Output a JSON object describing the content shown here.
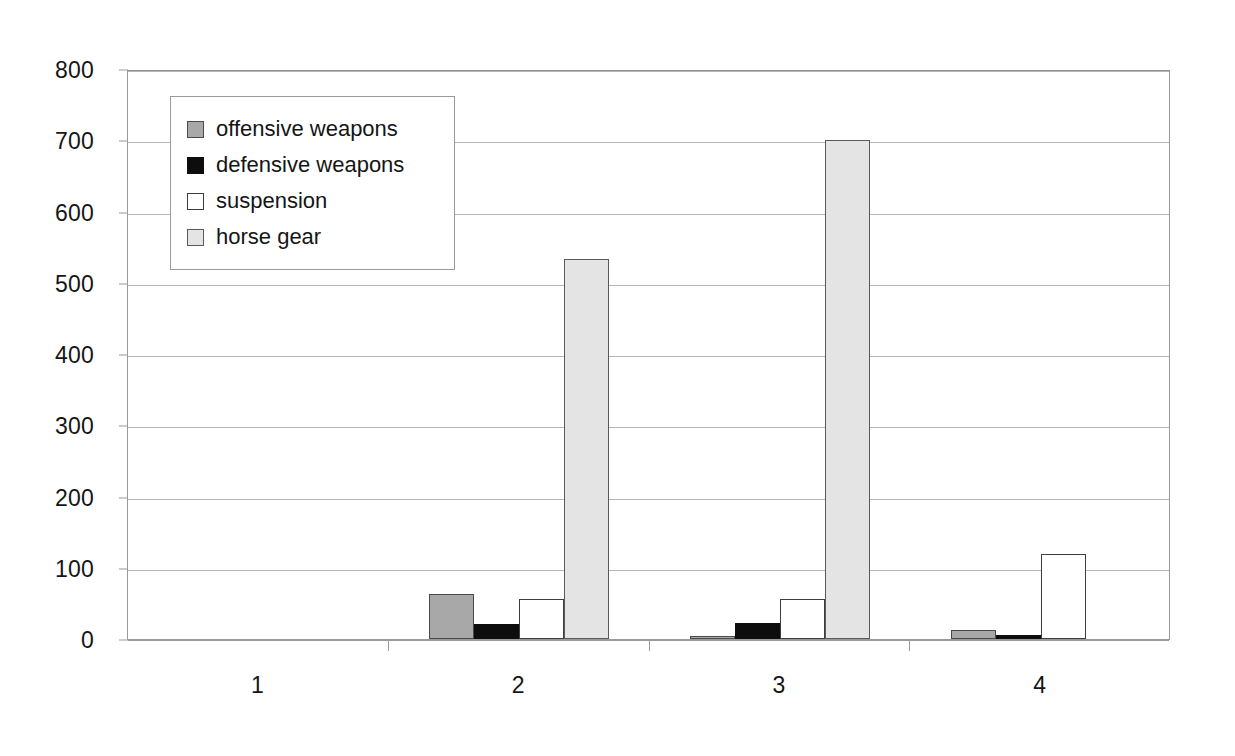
{
  "chart_data": {
    "type": "bar",
    "title": "",
    "subtitle": "",
    "xlabel": "",
    "ylabel": "",
    "categories": [
      "1",
      "2",
      "3",
      "4"
    ],
    "series": [
      {
        "name": "offensive weapons",
        "color": "#a8a8a8",
        "values": [
          0,
          63,
          3,
          12
        ]
      },
      {
        "name": "defensive weapons",
        "color": "#0d0d0d",
        "values": [
          0,
          21,
          23,
          5
        ]
      },
      {
        "name": "suspension",
        "color": "#ffffff",
        "values": [
          0,
          56,
          56,
          120
        ]
      },
      {
        "name": "horse gear",
        "color": "#e4e4e4",
        "values": [
          0,
          533,
          700,
          0
        ]
      }
    ],
    "ylim": [
      0,
      800
    ],
    "ytick_step": 100,
    "yticks": [
      "800",
      "700",
      "600",
      "500",
      "400",
      "300",
      "200",
      "100",
      "0"
    ],
    "grid": true,
    "grid_axis": "y",
    "legend_position": "upper-left-inside",
    "grouping": "grouped",
    "bar_border_color": "#3d3d3d",
    "plot_border_color": "#9a9a9a",
    "gridline_color": "#b5b5b5",
    "background_color": "#ffffff"
  }
}
